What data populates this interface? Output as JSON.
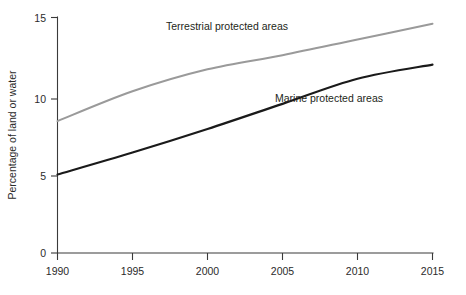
{
  "chart_data": {
    "type": "line",
    "title": "",
    "xlabel": "",
    "ylabel": "Percentage of land or water",
    "xlim": [
      1990,
      2015
    ],
    "ylim": [
      0,
      15
    ],
    "x_ticks": [
      1990,
      1995,
      2000,
      2005,
      2010,
      2015
    ],
    "x_tick_labels": [
      "1990",
      "1995",
      "2000",
      "2005",
      "2010",
      "2015"
    ],
    "y_ticks": [
      0,
      5,
      10,
      15
    ],
    "y_tick_labels": [
      "0",
      "5",
      "10",
      "15"
    ],
    "grid": false,
    "legend_position": "inline-labels",
    "x": [
      1990,
      1995,
      2000,
      2005,
      2010,
      2015
    ],
    "series": [
      {
        "name": "Terrestrial protected areas",
        "color": "#9a9a9a",
        "values": [
          8.4,
          10.3,
          11.7,
          12.6,
          13.6,
          14.6
        ],
        "label_text": "Terrestrial protected areas"
      },
      {
        "name": "Marine protected areas",
        "color": "#1a1a1a",
        "values": [
          5.0,
          6.4,
          7.9,
          9.5,
          11.1,
          12.0
        ],
        "label_text": "Marine protected areas"
      }
    ],
    "annotations": [
      {
        "text": "Terrestrial protected areas",
        "x": 2001.3,
        "y": 14.2
      },
      {
        "text": "Marine protected areas",
        "x": 2008.1,
        "y": 9.6
      }
    ]
  },
  "axis": {
    "y_title": "Percentage of land or water",
    "y_labels": {
      "0": "0",
      "5": "5",
      "10": "10",
      "15": "15"
    },
    "x_labels": {
      "1990": "1990",
      "1995": "1995",
      "2000": "2000",
      "2005": "2005",
      "2010": "2010",
      "2015": "2015"
    }
  },
  "labels": {
    "terrestrial": "Terrestrial protected areas",
    "marine": "Marine protected areas"
  }
}
